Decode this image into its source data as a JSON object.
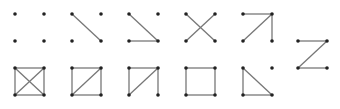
{
  "diagram": {
    "colors": {
      "edge": "#777777",
      "node": "#222222",
      "background": "#ffffff"
    },
    "graphs": [
      {
        "name": "empty",
        "ox": 15,
        "oy": 14,
        "edges": []
      },
      {
        "name": "one-diagonal",
        "ox": 72,
        "oy": 14,
        "edges": [
          [
            "tl",
            "br"
          ]
        ]
      },
      {
        "name": "diagonal-bottom",
        "ox": 129,
        "oy": 14,
        "edges": [
          [
            "tl",
            "br"
          ],
          [
            "bl",
            "br"
          ]
        ]
      },
      {
        "name": "cross",
        "ox": 186,
        "oy": 14,
        "edges": [
          [
            "tl",
            "br"
          ],
          [
            "tr",
            "bl"
          ]
        ]
      },
      {
        "name": "top-diag-right",
        "ox": 243,
        "oy": 14,
        "edges": [
          [
            "tl",
            "tr"
          ],
          [
            "bl",
            "tr"
          ],
          [
            "tr",
            "br"
          ]
        ]
      },
      {
        "name": "z-path",
        "ox": 298,
        "oy": 41,
        "edges": [
          [
            "tl",
            "tr"
          ],
          [
            "tr",
            "bl"
          ],
          [
            "bl",
            "br"
          ]
        ]
      },
      {
        "name": "complete-k4",
        "ox": 15,
        "oy": 68,
        "edges": [
          [
            "tl",
            "tr"
          ],
          [
            "tr",
            "br"
          ],
          [
            "br",
            "bl"
          ],
          [
            "bl",
            "tl"
          ],
          [
            "tl",
            "br"
          ],
          [
            "tr",
            "bl"
          ]
        ]
      },
      {
        "name": "square-diagonal",
        "ox": 72,
        "oy": 68,
        "edges": [
          [
            "tl",
            "tr"
          ],
          [
            "tr",
            "br"
          ],
          [
            "br",
            "bl"
          ],
          [
            "bl",
            "tl"
          ],
          [
            "tr",
            "bl"
          ]
        ]
      },
      {
        "name": "open-square-diagonal",
        "ox": 129,
        "oy": 68,
        "edges": [
          [
            "tl",
            "tr"
          ],
          [
            "tr",
            "br"
          ],
          [
            "bl",
            "tl"
          ],
          [
            "tr",
            "bl"
          ]
        ]
      },
      {
        "name": "square",
        "ox": 186,
        "oy": 68,
        "edges": [
          [
            "tl",
            "tr"
          ],
          [
            "tr",
            "br"
          ],
          [
            "br",
            "bl"
          ],
          [
            "bl",
            "tl"
          ]
        ]
      },
      {
        "name": "triangle-plus-point",
        "ox": 243,
        "oy": 68,
        "edges": [
          [
            "tl",
            "bl"
          ],
          [
            "bl",
            "br"
          ],
          [
            "tl",
            "br"
          ]
        ]
      }
    ],
    "size": 29
  }
}
